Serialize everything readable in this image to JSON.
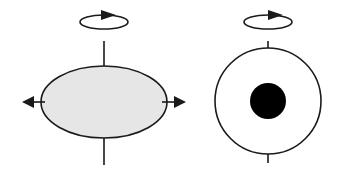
{
  "diagram": {
    "colors": {
      "stroke": "#1a1a1a",
      "ellipse_fill": "#e6e6e6",
      "circle_fill": "#ffffff",
      "core_fill": "#000000",
      "background": "#ffffff"
    },
    "figures": [
      {
        "id": "oblate-body",
        "shape": "ellipse",
        "center": [
          104,
          102
        ],
        "rx": 63,
        "ry": 36,
        "axis": {
          "x": 104,
          "top": [
            41,
            66
          ],
          "bottom": [
            137,
            165
          ]
        },
        "rotation_loop": {
          "center": [
            104,
            22
          ],
          "rx": 24,
          "ry": 7,
          "direction": "counter-clockwise-from-above"
        },
        "equatorial_arrows": [
          {
            "direction": "left",
            "from": 40,
            "to": 22,
            "y": 102
          },
          {
            "direction": "right",
            "from": 166,
            "to": 186,
            "y": 102
          }
        ]
      },
      {
        "id": "round-body",
        "shape": "circle",
        "center": [
          268,
          101
        ],
        "r": 53,
        "core": {
          "center": [
            268,
            101
          ],
          "r": 18
        },
        "axis": {
          "x": 268,
          "top": [
            41,
            48
          ],
          "bottom": [
            154,
            163
          ]
        },
        "rotation_loop": {
          "center": [
            268,
            22
          ],
          "rx": 24,
          "ry": 7,
          "direction": "counter-clockwise-from-above"
        }
      }
    ]
  }
}
